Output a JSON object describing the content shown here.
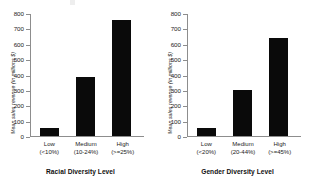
{
  "chart_data": [
    {
      "type": "bar",
      "title": "",
      "xlabel": "Racial Diversity Level",
      "ylabel": "Mean sales revenue (in millions $)",
      "categories": [
        "Low",
        "Medium",
        "High"
      ],
      "category_ranges": [
        "(<10%)",
        "(10-24%)",
        "(>=25%)"
      ],
      "values": [
        55,
        385,
        760
      ],
      "ylim": [
        0,
        800
      ],
      "yticks": [
        800,
        700,
        600,
        500,
        400,
        300,
        200,
        100,
        0
      ],
      "grid": false,
      "legend": "none",
      "bar_color": "#0a0a0a"
    },
    {
      "type": "bar",
      "title": "",
      "xlabel": "Gender Diversity Level",
      "ylabel": "Mean sales revenue (in millions $)",
      "categories": [
        "Low",
        "Medium",
        "High"
      ],
      "category_ranges": [
        "(<20%)",
        "(20-44%)",
        "(>=45%)"
      ],
      "values": [
        50,
        300,
        645
      ],
      "ylim": [
        0,
        800
      ],
      "yticks": [
        800,
        700,
        600,
        500,
        400,
        300,
        200,
        100,
        0
      ],
      "grid": false,
      "legend": "none",
      "bar_color": "#0a0a0a"
    }
  ]
}
